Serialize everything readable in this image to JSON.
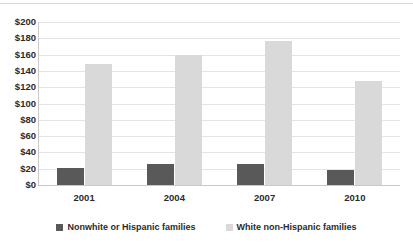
{
  "chart_data": {
    "type": "bar",
    "title": "",
    "subtitle": "",
    "xlabel": "",
    "ylabel": "",
    "categories": [
      "2001",
      "2004",
      "2007",
      "2010"
    ],
    "series": [
      {
        "name": "Nonwhite or Hispanic families",
        "color": "#595959",
        "values": [
          21,
          26,
          26,
          19
        ]
      },
      {
        "name": "White non-Hispanic families",
        "color": "#d9d9d9",
        "values": [
          148,
          159,
          177,
          128
        ]
      }
    ],
    "ylim": [
      0,
      200
    ],
    "ytick_step": 20,
    "ytick_labels": [
      "$200",
      "$180",
      "$160",
      "$140",
      "$120",
      "$100",
      "$80",
      "$60",
      "$40",
      "$20",
      "$0"
    ],
    "ytick_values": [
      200,
      180,
      160,
      140,
      120,
      100,
      80,
      60,
      40,
      20,
      0
    ],
    "grid": true,
    "legend_position": "bottom"
  },
  "legend": {
    "entries": [
      {
        "label": "Nonwhite or Hispanic families",
        "color": "#595959"
      },
      {
        "label": "White non-Hispanic families",
        "color": "#d9d9d9"
      }
    ]
  }
}
